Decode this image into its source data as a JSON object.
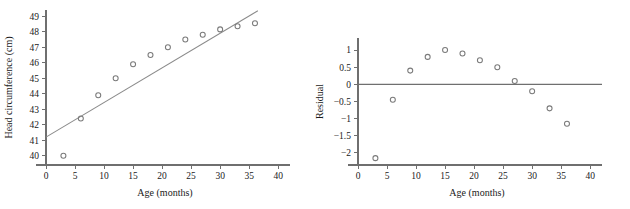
{
  "figure": {
    "name": "head-circumference-regression-and-residual-plots",
    "panel_count": 2
  },
  "chart_data": [
    {
      "id": "scatter-with-fit",
      "type": "scatter",
      "title": "",
      "xlabel": "Age (months)",
      "ylabel": "Head circumference (cm)",
      "xlim": [
        0,
        41
      ],
      "ylim": [
        39.4,
        49.4
      ],
      "xticks": [
        0,
        5,
        10,
        15,
        20,
        25,
        30,
        35,
        40
      ],
      "xticklabels": [
        "0",
        "5",
        "10",
        "15",
        "20",
        "25",
        "30",
        "35",
        "40"
      ],
      "yticks": [
        40,
        41,
        42,
        43,
        44,
        45,
        46,
        47,
        48,
        49
      ],
      "yticklabels": [
        "40",
        "41",
        "42",
        "43",
        "44",
        "45",
        "46",
        "47",
        "48",
        "49"
      ],
      "grid": false,
      "legend": false,
      "marker": "open-circle",
      "marker_color": "#7a7a7a",
      "x": [
        3,
        6,
        9,
        12,
        15,
        18,
        21,
        24,
        27,
        30,
        33,
        36
      ],
      "y": [
        40.0,
        42.4,
        43.9,
        45.0,
        45.9,
        46.5,
        47.0,
        47.5,
        47.8,
        48.15,
        48.35,
        48.55
      ],
      "series": [
        {
          "name": "Head circumference",
          "type": "scatter",
          "values": [
            40.0,
            42.4,
            43.9,
            45.0,
            45.9,
            46.5,
            47.0,
            47.5,
            47.8,
            48.15,
            48.35,
            48.55
          ]
        },
        {
          "name": "Least-squares line",
          "type": "line",
          "color": "#8a8a8a",
          "x_start": 0,
          "y_start": 41.2,
          "x_end": 36.5,
          "y_end": 49.35,
          "slope": 0.2233,
          "intercept": 41.2
        }
      ]
    },
    {
      "id": "residual-plot",
      "type": "scatter",
      "title": "",
      "xlabel": "Age (months)",
      "ylabel": "Residual",
      "xlim": [
        0,
        41
      ],
      "ylim": [
        -2.35,
        1.35
      ],
      "xticks": [
        0,
        5,
        10,
        15,
        20,
        25,
        30,
        35,
        40
      ],
      "xticklabels": [
        "0",
        "5",
        "10",
        "15",
        "20",
        "25",
        "30",
        "35",
        "40"
      ],
      "yticks": [
        1,
        0.5,
        0,
        -0.5,
        -1,
        -1.5,
        -2
      ],
      "yticklabels": [
        "1",
        "0.5",
        "0",
        "−0.5",
        "−1",
        "−1.5",
        "−2"
      ],
      "grid": false,
      "legend": false,
      "marker": "open-circle",
      "marker_color": "#7a7a7a",
      "reference_line_y": 0,
      "x": [
        3,
        6,
        9,
        12,
        15,
        18,
        21,
        24,
        27,
        30,
        33,
        36
      ],
      "y": [
        -2.15,
        -0.45,
        0.4,
        0.8,
        1.0,
        0.9,
        0.7,
        0.5,
        0.1,
        -0.2,
        -0.7,
        -1.15
      ],
      "series": [
        {
          "name": "Residual",
          "type": "scatter",
          "values": [
            -2.15,
            -0.45,
            0.4,
            0.8,
            1.0,
            0.9,
            0.7,
            0.5,
            0.1,
            -0.2,
            -0.7,
            -1.15
          ]
        }
      ]
    }
  ]
}
